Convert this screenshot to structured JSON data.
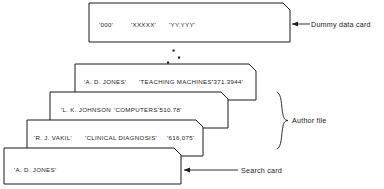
{
  "figure": {
    "stroke_color": "#1a1a1a",
    "background_color": "#ffffff"
  },
  "cards": {
    "dummy": {
      "name": "dummy-data-card",
      "fields": [
        "'000'",
        "'XXXXX'",
        "'YY,YYY'"
      ],
      "field_000": "'000'",
      "field_xxxxx": "'XXXXX'",
      "field_yyyyy": "'YY,YYY'"
    },
    "author_file": [
      {
        "author": "'A. D. JONES'",
        "title": "'TEACHING MACHINES'",
        "call_number": "'371.3944'"
      },
      {
        "author": "'L. K. JOHNSON",
        "title": "'COMPUTERS",
        "call_number": "'510.78'"
      },
      {
        "author": "'R. J. VAKIL'",
        "title": "'CLINICAL DIAGNOSIS'",
        "call_number": "'616,075'"
      }
    ],
    "search": {
      "name": "search-card",
      "author": "'A. D. JONES'"
    }
  },
  "annotations": {
    "dummy_data_card": "Dummy data card",
    "author_file": "Author file",
    "search_card": "Search card",
    "ellipsis": "⋰"
  }
}
